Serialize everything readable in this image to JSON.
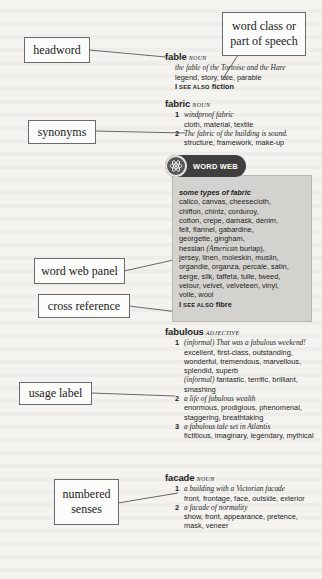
{
  "callouts": {
    "word_class": "word class or part of speech",
    "headword": "headword",
    "synonyms": "synonyms",
    "word_web_panel": "word web panel",
    "cross_reference": "cross reference",
    "usage_label": "usage label",
    "numbered_senses": "numbered senses"
  },
  "entries": {
    "fable": {
      "headword": "fable",
      "pos": "NOUN",
      "example": "the fable of the Tortoise and the Hare",
      "synonyms": "legend, story, tale, parable",
      "see_also_bar": "I",
      "see_also_label": "SEE ALSO",
      "see_also_target": "fiction"
    },
    "fabric": {
      "headword": "fabric",
      "pos": "NOUN",
      "senses": [
        {
          "num": "1",
          "example": "windproof fabric",
          "synonyms": "cloth, material, textile"
        },
        {
          "num": "2",
          "example": "The fabric of the building is sound.",
          "synonyms": "structure, framework, make-up"
        }
      ]
    },
    "word_web": {
      "badge_label": "WORD WEB",
      "badge_icon": "atom-icon",
      "title": "some types of fabric",
      "lines": [
        "calico, canvas, cheesecloth,",
        "chiffon, chintz, corduroy,",
        "cotton, crepe, damask, denim,",
        "felt, flannel, gabardine,",
        "georgette, gingham,",
        "hessian",
        "(American",
        "burlap),",
        "jersey, linen, moleskin, muslin,",
        "organdie, organza, percale, satin,",
        "serge, silk, taffeta, tulle, tweed,",
        "velour, velvet, velveteen, vinyl,",
        "voile, wool"
      ],
      "see_also_bar": "I",
      "see_also_label": "SEE ALSO",
      "see_also_target": "fibre"
    },
    "fabulous": {
      "headword": "fabulous",
      "pos": "ADJECTIVE",
      "senses": [
        {
          "num": "1",
          "label": "(informal)",
          "example": "That was a fabulous weekend!",
          "synonyms": "excellent, first-class, outstanding, wonderful, tremendous, marvellous, splendid, superb",
          "extra_label": "(informal)",
          "extra_synonyms": "fantastic, terrific, brilliant, smashing"
        },
        {
          "num": "2",
          "example": "a life of fabulous wealth",
          "synonyms": "enormous, prodigious, phenomenal, staggering, breathtaking"
        },
        {
          "num": "3",
          "example": "a fabulous tale set in Atlantis",
          "synonyms": "fictitious, imaginary, legendary, mythical"
        }
      ]
    },
    "facade": {
      "headword": "facade",
      "pos": "NOUN",
      "senses": [
        {
          "num": "1",
          "example": "a building with a Victorian facade",
          "synonyms": "front, frontage, face, outside, exterior"
        },
        {
          "num": "2",
          "example": "a facade of normality",
          "synonyms": "show, front, appearance, pretence, mask, veneer"
        }
      ]
    }
  }
}
